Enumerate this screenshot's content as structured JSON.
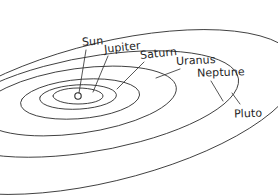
{
  "diagram": {
    "type": "solar-system-orbit-perspective-sketch",
    "style": "hand-drawn line sketch",
    "background_color": "#ffffff",
    "line_color": "#2b2b2b",
    "center_body": {
      "name": "Sun",
      "marker": "small open circle",
      "x": 78,
      "y": 96
    },
    "labels": {
      "sun": "Sun",
      "jupiter": "Jupiter",
      "saturn": "Saturn",
      "uranus": "Uranus",
      "neptune": "Neptune",
      "pluto": "Pluto"
    },
    "orbits": [
      {
        "name": "Jupiter",
        "order": 1,
        "path": "M 53 96 a 25 8 0 1 0 50 0 a 25 8 0 1 0 -50 0"
      },
      {
        "name": "Saturn",
        "order": 2,
        "path": "M 40 97 a 38 12 -3 1 0 76 0 a 38 12 -3 1 0 -76 0"
      },
      {
        "name": "Uranus",
        "order": 3,
        "path": "M 22 99 a 58 19 -5 1 0 116 0 a 58 19 -5 1 0 -116 0"
      },
      {
        "name": "Neptune",
        "order": 4,
        "path": "M -14 101 a 92 30 -8 1 0 184 0 a 92 30 -8 1 0 -184 0"
      },
      {
        "name": "Neptune-outer",
        "order": 5,
        "path": "M -40 104 a 132 42 -10 1 0 264 0 a 132 42 -10 1 0 -264 0"
      },
      {
        "name": "Pluto",
        "order": 6,
        "path": "M -60 112 a 166 58 -14 1 0 332 0 a 166 58 -14 1 0 -332 0"
      }
    ],
    "leaders": [
      {
        "name": "sun-leader",
        "path": "M 86 50 L 79 93"
      },
      {
        "name": "jupiter-leader",
        "path": "M 108 56 L 93 92"
      },
      {
        "name": "saturn-leader",
        "path": "M 144 62 L 117 89"
      },
      {
        "name": "uranus-leader",
        "path": "M 180 69 L 156 78"
      },
      {
        "name": "neptune-leader",
        "path": "M 211 81 L 223 101"
      },
      {
        "name": "pluto-leader",
        "path": "M 240 104 L 232 93"
      }
    ]
  }
}
